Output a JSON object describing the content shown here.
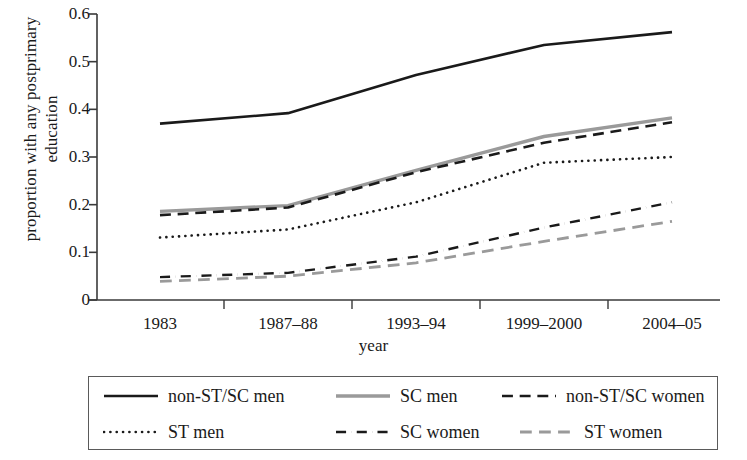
{
  "chart_data": {
    "type": "line",
    "title": "",
    "xlabel": "year",
    "ylabel": "proportion with any postprimary education",
    "categories": [
      "1983",
      "1987–88",
      "1993–94",
      "1999–2000",
      "2004–05"
    ],
    "ylim": [
      0,
      0.6
    ],
    "yticks": [
      "0",
      "0.1",
      "0.2",
      "0.3",
      "0.4",
      "0.5",
      "0.6"
    ],
    "ytick_values": [
      0,
      0.1,
      0.2,
      0.3,
      0.4,
      0.5,
      0.6
    ],
    "grid": false,
    "legend_position": "bottom",
    "series": [
      {
        "name": "non-ST/SC men",
        "values": [
          0.37,
          0.392,
          0.472,
          0.535,
          0.562
        ],
        "color": "#1a1a1a",
        "style": "solid",
        "width": 2.6
      },
      {
        "name": "SC men",
        "values": [
          0.186,
          0.198,
          0.272,
          0.343,
          0.382
        ],
        "color": "#9a9a9a",
        "style": "solid",
        "width": 3.4
      },
      {
        "name": "non-ST/SC women",
        "values": [
          0.178,
          0.194,
          0.268,
          0.33,
          0.373
        ],
        "color": "#1a1a1a",
        "style": "dashed",
        "width": 2.6
      },
      {
        "name": "ST men",
        "values": [
          0.131,
          0.148,
          0.205,
          0.288,
          0.3
        ],
        "color": "#1a1a1a",
        "style": "dotted",
        "width": 2.6
      },
      {
        "name": "SC women",
        "values": [
          0.048,
          0.057,
          0.091,
          0.152,
          0.205
        ],
        "color": "#1a1a1a",
        "style": "dashdot",
        "width": 2.4
      },
      {
        "name": "ST women",
        "values": [
          0.039,
          0.05,
          0.078,
          0.123,
          0.165
        ],
        "color": "#9a9a9a",
        "style": "dashed",
        "width": 2.8
      }
    ]
  },
  "legend": {
    "rows": [
      [
        "non-ST/SC men",
        "SC men",
        "non-ST/SC women"
      ],
      [
        "ST men",
        "SC women",
        "ST women"
      ]
    ]
  }
}
